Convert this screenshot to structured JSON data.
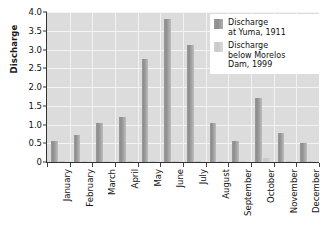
{
  "chart_data": {
    "type": "bar",
    "title": "",
    "xlabel": "",
    "ylabel": "Discharge",
    "ylim": [
      0,
      4.0
    ],
    "ytick_step": 0.5,
    "grid": true,
    "legend_position": "top-right",
    "categories": [
      "January",
      "February",
      "March",
      "April",
      "May",
      "June",
      "July",
      "August",
      "September",
      "October",
      "November",
      "December"
    ],
    "series": [
      {
        "name": "Discharge at Yuma, 1911",
        "color": "#9a9a9a",
        "legend_line1": "Discharge",
        "legend_line2": "at Yuma, 1911",
        "values": [
          0.57,
          0.72,
          1.04,
          1.19,
          2.75,
          3.82,
          3.12,
          1.05,
          0.56,
          1.72,
          0.77,
          0.52
        ]
      },
      {
        "name": "Discharge below Morelos Dam, 1999",
        "color": "#cfcfcf",
        "legend_line1": "Discharge",
        "legend_line2": "below Morelos",
        "legend_line3": "Dam, 1999",
        "values": [
          0.02,
          0.02,
          0.02,
          0.02,
          0.02,
          0.02,
          0.02,
          0.02,
          0.02,
          0.1,
          0.03,
          0.02
        ]
      }
    ],
    "ytick_labels": [
      "4.0",
      "3.5",
      "3.0",
      "2.5",
      "2.0",
      "1.5",
      "1.0",
      "0.5",
      "0"
    ],
    "ytick_values": [
      4.0,
      3.5,
      3.0,
      2.5,
      2.0,
      1.5,
      1.0,
      0.5,
      0
    ]
  },
  "axis": {
    "y_title": "Discharge"
  }
}
